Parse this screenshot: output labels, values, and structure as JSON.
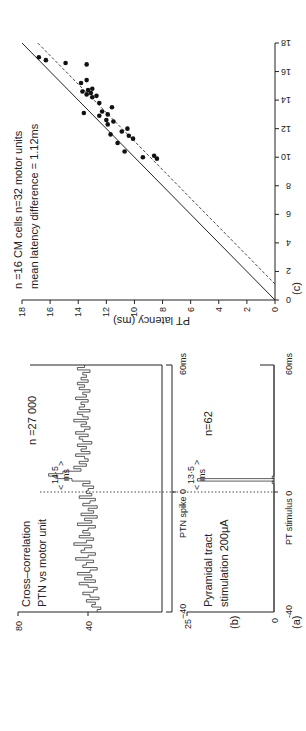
{
  "figure": {
    "orientation": "rotated 90 degrees counter-clockwise",
    "panel_a": {
      "label": "(a)",
      "title_line1": "Cross–correlation",
      "title_line2": "PTN vs motor unit",
      "n_label": "n =27 000",
      "latency_label": "14·5",
      "latency_unit": "ms",
      "x_zero_label": "PTN spike 0",
      "x_end_label": "60ms",
      "x_start_label": "−40",
      "y_ticks": [
        "80",
        "40"
      ]
    },
    "panel_b": {
      "label": "(b)",
      "title_line1": "Pyramidal  tract",
      "title_line2": "stimulation  200μA",
      "n_label": "n=62",
      "latency_label": "13·5",
      "latency_unit": "ms",
      "x_zero_label": "PT stimulus 0",
      "x_end_label": "60ms",
      "x_start_label": "-40",
      "y_ticks": [
        "25",
        "0"
      ]
    },
    "panel_c": {
      "label": "(c)",
      "annotation_line1": "n =16 CM cells    n=32 motor units",
      "annotation_line2": "mean latency difference = 1.12ms",
      "y_axis_label": "PT latency (ms)"
    }
  },
  "chart_data": [
    {
      "type": "bar",
      "subtype": "histogram (cross-correlogram)",
      "title": "Cross-correlation PTN vs motor unit",
      "panel": "(a)",
      "xlabel": "Time relative to PTN spike (ms)",
      "ylabel": "Counts",
      "xlim": [
        -40,
        60
      ],
      "ylim": [
        0,
        80
      ],
      "y_ticks": [
        40,
        80
      ],
      "x_tick_labels": [
        "-40",
        "0",
        "60ms"
      ],
      "annotations": [
        "n =27 000",
        "14.5 ms (onset-to-peak latency, dotted line at 0)"
      ],
      "bin_ms": 1,
      "x": [
        -40,
        -39,
        -38,
        -37,
        -36,
        -35,
        -34,
        -33,
        -32,
        -31,
        -30,
        -29,
        -28,
        -27,
        -26,
        -25,
        -24,
        -23,
        -22,
        -21,
        -20,
        -19,
        -18,
        -17,
        -16,
        -15,
        -14,
        -13,
        -12,
        -11,
        -10,
        -9,
        -8,
        -7,
        -6,
        -5,
        -4,
        -3,
        -2,
        -1,
        0,
        1,
        2,
        3,
        4,
        5,
        6,
        7,
        8,
        9,
        10,
        11,
        12,
        13,
        14,
        15,
        16,
        17,
        18,
        19,
        20,
        21,
        22,
        23,
        24,
        25,
        26,
        27,
        28,
        29,
        30,
        31,
        32,
        33,
        34,
        35,
        36,
        37,
        38,
        39,
        40,
        41,
        42,
        43,
        44,
        45,
        46,
        47,
        48,
        49,
        50,
        51,
        52,
        53,
        54,
        55,
        56,
        57,
        58,
        59
      ],
      "values": [
        36,
        34,
        39,
        37,
        42,
        35,
        40,
        44,
        38,
        36,
        41,
        46,
        37,
        43,
        39,
        47,
        40,
        36,
        44,
        42,
        38,
        48,
        41,
        37,
        45,
        43,
        39,
        49,
        42,
        38,
        46,
        40,
        44,
        41,
        37,
        47,
        39,
        43,
        36,
        45,
        38,
        41,
        36,
        44,
        40,
        37,
        46,
        39,
        42,
        41,
        38,
        44,
        40,
        50,
        58,
        63,
        55,
        45,
        49,
        42,
        46,
        41,
        43,
        48,
        40,
        45,
        42,
        47,
        39,
        44,
        46,
        41,
        48,
        43,
        40,
        45,
        42,
        49,
        41,
        44,
        47,
        40,
        46,
        43,
        45,
        41,
        48,
        42,
        44,
        40,
        46,
        43,
        47,
        41,
        45,
        42,
        44,
        40,
        47,
        43
      ]
    },
    {
      "type": "bar",
      "subtype": "histogram (post-stimulus time histogram)",
      "title": "Pyramidal tract stimulation 200μA",
      "panel": "(b)",
      "xlabel": "Time relative to PT stimulus (ms)",
      "ylabel": "Counts",
      "xlim": [
        -40,
        60
      ],
      "ylim": [
        0,
        25
      ],
      "y_ticks": [
        0,
        25
      ],
      "x_tick_labels": [
        "-40",
        "0",
        "60ms"
      ],
      "annotations": [
        "n=62",
        "13.5 ms"
      ],
      "bin_ms": 1,
      "x": [
        12,
        13,
        14
      ],
      "values": [
        0.5,
        22,
        0.5
      ],
      "note": "All other bins are zero; single sharp peak at ~13.5 ms"
    },
    {
      "type": "scatter",
      "panel": "(c)",
      "title": "",
      "xlabel": "CM cell cross-correlation latency (ms)",
      "ylabel": "PT latency (ms)",
      "xlim": [
        0,
        18
      ],
      "ylim": [
        0,
        18
      ],
      "x_ticks": [
        0,
        2,
        4,
        6,
        8,
        10,
        12,
        14,
        16,
        18
      ],
      "y_ticks": [
        0,
        2,
        4,
        6,
        8,
        10,
        12,
        14,
        16,
        18
      ],
      "grid": false,
      "annotations": [
        "n =16 CM cells",
        "n=32 motor units",
        "mean latency difference = 1.12ms"
      ],
      "lines": [
        {
          "name": "identity (y = x)",
          "style": "solid",
          "points": [
            [
              0,
              0
            ],
            [
              18,
              18
            ]
          ]
        },
        {
          "name": "mean offset (y = x - 1.12)",
          "style": "dashed",
          "points": [
            [
              1.12,
              0
            ],
            [
              18,
              16.88
            ]
          ]
        }
      ],
      "points": [
        [
          17.0,
          16.8
        ],
        [
          16.8,
          16.3
        ],
        [
          16.6,
          14.9
        ],
        [
          16.5,
          13.4
        ],
        [
          15.4,
          13.4
        ],
        [
          15.2,
          13.8
        ],
        [
          14.8,
          13.0
        ],
        [
          14.7,
          13.3
        ],
        [
          14.6,
          13.7
        ],
        [
          14.5,
          13.1
        ],
        [
          14.4,
          13.4
        ],
        [
          14.2,
          13.0
        ],
        [
          14.3,
          12.7
        ],
        [
          13.8,
          12.5
        ],
        [
          13.5,
          11.6
        ],
        [
          13.2,
          12.3
        ],
        [
          13.0,
          11.9
        ],
        [
          12.9,
          12.5
        ],
        [
          12.6,
          12.0
        ],
        [
          12.5,
          11.5
        ],
        [
          12.3,
          11.9
        ],
        [
          12.0,
          10.5
        ],
        [
          11.8,
          10.9
        ],
        [
          11.6,
          11.7
        ],
        [
          11.5,
          10.4
        ],
        [
          11.3,
          10.1
        ],
        [
          11.0,
          11.2
        ],
        [
          10.4,
          10.7
        ],
        [
          10.0,
          9.4
        ],
        [
          9.9,
          8.4
        ],
        [
          10.1,
          8.6
        ],
        [
          13.1,
          13.6
        ]
      ]
    }
  ]
}
